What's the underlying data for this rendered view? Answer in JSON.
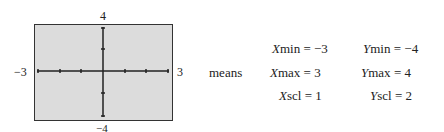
{
  "graph": {
    "labels": {
      "top": "4",
      "bottom": "−4",
      "left": "−3",
      "right": "3"
    },
    "screen_color": "#dcdcdc"
  },
  "connector": "means",
  "settings": [
    {
      "var": "X",
      "name": "min",
      "value": "−3"
    },
    {
      "var": "Y",
      "name": "min",
      "value": "−4"
    },
    {
      "var": "X",
      "name": "max",
      "value": "3"
    },
    {
      "var": "Y",
      "name": "max",
      "value": "4"
    },
    {
      "var": "X",
      "name": "scl",
      "value": "1"
    },
    {
      "var": "Y",
      "name": "scl",
      "value": "2"
    }
  ]
}
